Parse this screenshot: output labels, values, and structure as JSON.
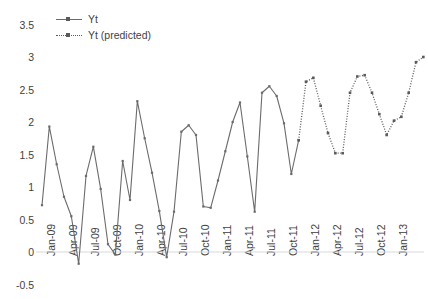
{
  "chart_data": {
    "type": "line",
    "title": "",
    "xlabel": "",
    "ylabel": "",
    "ylim": [
      -0.5,
      3.5
    ],
    "yticks": [
      -0.5,
      0,
      0.5,
      1,
      1.5,
      2,
      2.5,
      3,
      3.5
    ],
    "ytick_labels": [
      "-0.5",
      "0",
      "0.5",
      "1",
      "1.5",
      "2",
      "2.5",
      "3",
      "3.5"
    ],
    "xtick_labels": [
      "Jan-09",
      "Apr-09",
      "Jul-09",
      "Oct-09",
      "Jan-10",
      "Apr-10",
      "Jul-10",
      "Oct-10",
      "Jan-11",
      "Apr-11",
      "Jul-11",
      "Oct-11",
      "Jan-12",
      "Apr-12",
      "Jul-12",
      "Oct-12",
      "Jan-13"
    ],
    "xtick_indices": [
      0,
      3,
      6,
      9,
      12,
      15,
      18,
      21,
      24,
      27,
      30,
      33,
      36,
      39,
      42,
      45,
      48
    ],
    "grid": false,
    "legend_position": "top-left",
    "series": [
      {
        "name": "Yt",
        "style": "solid",
        "color": "#6b6b6b",
        "x_start_index": 0,
        "values": [
          0.72,
          1.93,
          1.35,
          0.85,
          0.55,
          -0.18,
          1.17,
          1.62,
          0.97,
          0.12,
          -0.04,
          1.4,
          0.8,
          2.32,
          1.75,
          1.22,
          0.63,
          -0.08,
          0.62,
          1.85,
          1.95,
          1.8,
          0.7,
          0.68,
          1.1,
          1.55,
          2.0,
          2.3,
          1.47,
          0.62,
          2.45,
          2.55,
          2.4,
          1.98,
          1.2,
          1.72
        ]
      },
      {
        "name": "Yt (predicted)",
        "style": "dotted",
        "color": "#5a5a5a",
        "x_start_index": 35,
        "values": [
          1.72,
          2.62,
          2.68,
          2.25,
          1.83,
          1.52,
          1.52,
          2.45,
          2.7,
          2.72,
          2.45,
          2.12,
          1.8,
          2.02,
          2.08,
          2.45,
          2.92,
          3.0
        ]
      }
    ]
  },
  "legend": {
    "items": [
      {
        "label": "Yt",
        "style": "solid"
      },
      {
        "label": "Yt (predicted)",
        "style": "dotted"
      }
    ]
  }
}
